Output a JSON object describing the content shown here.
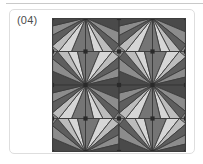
{
  "figure": {
    "label": "(04)",
    "background_color": "#ffffff",
    "frame_color": "#dedede",
    "rule_color": "#c9c9c9"
  },
  "pattern": {
    "name": "triangular-tiling-pattern",
    "grid_rows": 4,
    "grid_cols": 4,
    "cell_size": 33.5,
    "origin_x": 52,
    "origin_y": 18,
    "size": 134,
    "base_fill": "#8e8e8e",
    "edge_color": "#3d3d3d",
    "edge_width": 0.9,
    "vertex_dot_color": "#2a2a2a",
    "vertex_dot_radius": 2.1,
    "palette": {
      "darkest": "#4a4a4a",
      "dark": "#5e5e5e",
      "mid_dark": "#757575",
      "mid": "#8c8c8c",
      "mid_light": "#a3a3a3",
      "light": "#bcbcbc",
      "lightest": "#d6d6d6",
      "near_white": "#e4e4e4"
    },
    "cells": [
      {
        "row": 0,
        "col": 0,
        "apex": "tr",
        "shades": [
          "mid_dark",
          "lightest",
          "light",
          "dark",
          "mid",
          "darkest"
        ]
      },
      {
        "row": 0,
        "col": 1,
        "apex": "tl",
        "shades": [
          "darkest",
          "mid",
          "dark",
          "light",
          "lightest",
          "mid_dark"
        ]
      },
      {
        "row": 0,
        "col": 2,
        "apex": "tr",
        "shades": [
          "mid_dark",
          "lightest",
          "light",
          "dark",
          "mid",
          "darkest"
        ]
      },
      {
        "row": 0,
        "col": 3,
        "apex": "tl",
        "shades": [
          "darkest",
          "mid",
          "dark",
          "light",
          "lightest",
          "mid_dark"
        ]
      },
      {
        "row": 1,
        "col": 0,
        "apex": "br",
        "shades": [
          "darkest",
          "mid",
          "dark",
          "light",
          "lightest",
          "mid_dark"
        ]
      },
      {
        "row": 1,
        "col": 1,
        "apex": "bl",
        "shades": [
          "mid_dark",
          "lightest",
          "light",
          "dark",
          "mid",
          "darkest"
        ]
      },
      {
        "row": 1,
        "col": 2,
        "apex": "br",
        "shades": [
          "darkest",
          "mid",
          "dark",
          "light",
          "lightest",
          "mid_dark"
        ]
      },
      {
        "row": 1,
        "col": 3,
        "apex": "bl",
        "shades": [
          "mid_dark",
          "lightest",
          "light",
          "dark",
          "mid",
          "darkest"
        ]
      },
      {
        "row": 2,
        "col": 0,
        "apex": "tr",
        "shades": [
          "mid_dark",
          "lightest",
          "light",
          "dark",
          "mid",
          "darkest"
        ]
      },
      {
        "row": 2,
        "col": 1,
        "apex": "tl",
        "shades": [
          "darkest",
          "mid",
          "dark",
          "light",
          "lightest",
          "mid_dark"
        ]
      },
      {
        "row": 2,
        "col": 2,
        "apex": "tr",
        "shades": [
          "mid_dark",
          "lightest",
          "light",
          "dark",
          "mid",
          "darkest"
        ]
      },
      {
        "row": 2,
        "col": 3,
        "apex": "tl",
        "shades": [
          "darkest",
          "mid",
          "dark",
          "light",
          "lightest",
          "mid_dark"
        ]
      },
      {
        "row": 3,
        "col": 0,
        "apex": "br",
        "shades": [
          "darkest",
          "mid",
          "dark",
          "light",
          "lightest",
          "mid_dark"
        ]
      },
      {
        "row": 3,
        "col": 1,
        "apex": "bl",
        "shades": [
          "mid_dark",
          "lightest",
          "light",
          "dark",
          "mid",
          "darkest"
        ]
      },
      {
        "row": 3,
        "col": 2,
        "apex": "br",
        "shades": [
          "darkest",
          "mid",
          "dark",
          "light",
          "lightest",
          "mid_dark"
        ]
      },
      {
        "row": 3,
        "col": 3,
        "apex": "bl",
        "shades": [
          "mid_dark",
          "lightest",
          "light",
          "dark",
          "mid",
          "darkest"
        ]
      }
    ],
    "fan_fractions": [
      0.0,
      0.21,
      0.4,
      0.58,
      0.74,
      0.88,
      1.0
    ]
  }
}
